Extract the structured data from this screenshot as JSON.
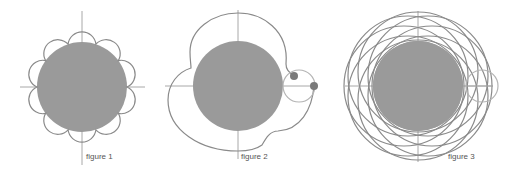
{
  "figures": [
    {
      "id": "figure-1",
      "label": "figure 1",
      "description": "Fixed disc with 10 small scallop arcs around it (epicycloid-like trace)",
      "center": [
        82,
        87
      ],
      "disc_radius": 45,
      "petals": 10
    },
    {
      "id": "figure-2",
      "label": "figure 2",
      "description": "Fixed disc with a small rolling circle on the right, two tracing points, and the partial epicycloid traced outline",
      "center": [
        238,
        86
      ],
      "disc_radius": 45,
      "rolling_circle": {
        "center": [
          299,
          86
        ],
        "radius": 16
      },
      "points": [
        [
          294,
          76
        ],
        [
          314,
          86
        ]
      ]
    },
    {
      "id": "figure-3",
      "label": "figure 3",
      "description": "Fixed disc with a small rolling circle and overlapping looped trace curves forming a rosette",
      "center": [
        418,
        86
      ],
      "disc_radius": 45,
      "rolling_circle": {
        "center": [
          482,
          86
        ],
        "radius": 16
      }
    }
  ],
  "colors": {
    "disc": "#9a9a9a",
    "curve": "#8a8a8a",
    "axis": "#a8a8a8",
    "rolling_circle": "#b4b4b4",
    "point": "#7a7a7a",
    "label": "#555555"
  }
}
